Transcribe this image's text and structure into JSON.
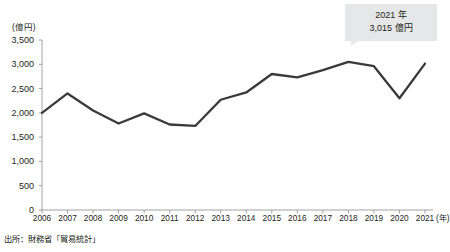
{
  "chart_data": {
    "type": "line",
    "title": "",
    "subtitle": "",
    "xlabel": "(年)",
    "ylabel": "(億円)",
    "unit_label": "(億円)",
    "x_unit_label": "(年)",
    "categories": [
      "2006",
      "2007",
      "2008",
      "2009",
      "2010",
      "2011",
      "2012",
      "2013",
      "2014",
      "2015",
      "2016",
      "2017",
      "2018",
      "2019",
      "2020",
      "2021"
    ],
    "values": [
      2000,
      2400,
      2050,
      1780,
      1990,
      1760,
      1730,
      2270,
      2420,
      2800,
      2730,
      2880,
      3050,
      2960,
      2300,
      3015
    ],
    "series": [
      {
        "name": "輸出額",
        "values": [
          2000,
          2400,
          2050,
          1780,
          1990,
          1760,
          1730,
          2270,
          2420,
          2800,
          2730,
          2880,
          3050,
          2960,
          2300,
          3015
        ]
      }
    ],
    "ylim": [
      0,
      3500
    ],
    "y_ticks": [
      0,
      500,
      1000,
      1500,
      2000,
      2500,
      3000,
      3500
    ],
    "y_tick_labels": [
      "0",
      "500",
      "1,000",
      "1,500",
      "2,000",
      "2,500",
      "3,000",
      "3,500"
    ],
    "grid": false,
    "legend": "none",
    "line_color": "#3a3a3a",
    "axis_color": "#8c8c8c",
    "annotations": [
      {
        "target_category": "2021",
        "target_value": 3015,
        "line1": "2021 年",
        "line2": "3,015 億円",
        "background": "#e6e7e8"
      }
    ]
  },
  "callout": {
    "line1": "2021 年",
    "line2": "3,015 億円"
  },
  "source": {
    "text": "出所：財務省「貿易統計」"
  }
}
